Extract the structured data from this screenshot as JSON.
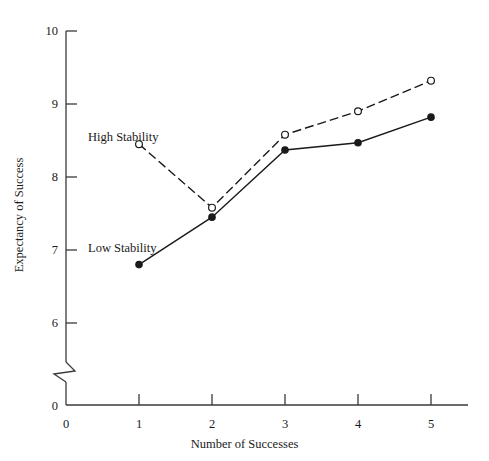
{
  "chart_data": {
    "type": "line",
    "title": "",
    "xlabel": "Number of Successes",
    "ylabel": "Expectancy of Success",
    "x": [
      1,
      2,
      3,
      4,
      5
    ],
    "xlim": [
      0,
      5
    ],
    "ylim": [
      6,
      10
    ],
    "y_axis_break": true,
    "y_axis_break_note": "axis broken between 0 and 6",
    "grid": false,
    "legend_position": "inline-annotations",
    "xticks": [
      "0",
      "1",
      "2",
      "3",
      "4",
      "5"
    ],
    "yticks": [
      "10",
      "9",
      "8",
      "7",
      "6",
      "0"
    ],
    "series": [
      {
        "name": "High Stability",
        "values": [
          8.45,
          7.58,
          8.58,
          8.9,
          9.32
        ],
        "line_style": "dashed",
        "marker": "open-circle",
        "color": "#1a1a1a",
        "label_x": 88,
        "label_y": 130
      },
      {
        "name": "Low Stability",
        "values": [
          6.8,
          7.45,
          8.37,
          8.47,
          8.82
        ],
        "line_style": "solid",
        "marker": "filled-circle",
        "color": "#1a1a1a",
        "label_x": 88,
        "label_y": 241
      }
    ]
  },
  "axes": {
    "line_color": "#3a3a3a",
    "x_axis_y_px": 405,
    "y_axis_x_px": 66,
    "y_top_px": 31,
    "px_per_unit": 73,
    "x_left_px": 66,
    "x_right_px": 468
  }
}
